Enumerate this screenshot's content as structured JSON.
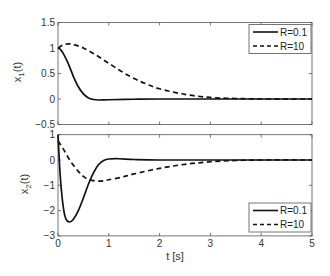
{
  "chart_data": [
    {
      "type": "line",
      "title": "",
      "xlabel": "",
      "ylabel": "x1(t)",
      "ylabel_main": "x",
      "ylabel_sub": "1",
      "ylabel_tail": "(t)",
      "xlim": [
        0,
        5
      ],
      "ylim": [
        -0.5,
        1.5
      ],
      "xticks": [
        "0",
        "1",
        "2",
        "3",
        "4",
        "5"
      ],
      "yticks": [
        "1.5",
        "1",
        "0.5",
        "0",
        "-0.5"
      ],
      "ytick_values": [
        1.5,
        1,
        0.5,
        0,
        -0.5
      ],
      "show_xtick_labels": false,
      "grid": false,
      "legend_position": "upper right",
      "legend": [
        "R=0.1",
        "R=10"
      ],
      "series": [
        {
          "name": "R=0.1",
          "style": "solid",
          "x": [
            0,
            0.05,
            0.1,
            0.2,
            0.3,
            0.4,
            0.5,
            0.6,
            0.7,
            0.8,
            1.0,
            1.5,
            2,
            3,
            4,
            5
          ],
          "y": [
            1.0,
            0.97,
            0.9,
            0.7,
            0.45,
            0.24,
            0.1,
            0.02,
            -0.01,
            -0.02,
            -0.015,
            -0.005,
            0,
            0,
            0,
            0
          ]
        },
        {
          "name": "R=10",
          "style": "dashed",
          "x": [
            0,
            0.1,
            0.2,
            0.3,
            0.5,
            0.75,
            1.0,
            1.25,
            1.5,
            1.75,
            2.0,
            2.5,
            3.0,
            3.5,
            4,
            5
          ],
          "y": [
            1.0,
            1.06,
            1.08,
            1.07,
            1.0,
            0.86,
            0.7,
            0.54,
            0.4,
            0.29,
            0.2,
            0.09,
            0.03,
            0.01,
            0,
            0
          ]
        }
      ]
    },
    {
      "type": "line",
      "title": "",
      "xlabel": "t [s]",
      "ylabel": "x2(t)",
      "ylabel_main": "x",
      "ylabel_sub": "2",
      "ylabel_tail": "(t)",
      "xlim": [
        0,
        5
      ],
      "ylim": [
        -3,
        1
      ],
      "xticks": [
        "0",
        "1",
        "2",
        "3",
        "4",
        "5"
      ],
      "yticks": [
        "1",
        "0",
        "-1",
        "-2",
        "-3"
      ],
      "ytick_values": [
        1,
        0,
        -1,
        -2,
        -3
      ],
      "show_xtick_labels": true,
      "grid": false,
      "legend_position": "lower right",
      "legend": [
        "R=0.1",
        "R=10"
      ],
      "series": [
        {
          "name": "R=0.1",
          "style": "solid",
          "x": [
            0,
            0.02,
            0.05,
            0.1,
            0.15,
            0.22,
            0.3,
            0.4,
            0.5,
            0.6,
            0.7,
            0.8,
            0.9,
            1.0,
            1.2,
            1.5,
            2,
            3,
            4,
            5
          ],
          "y": [
            1.0,
            0.2,
            -0.8,
            -1.8,
            -2.3,
            -2.45,
            -2.35,
            -2.0,
            -1.5,
            -0.95,
            -0.5,
            -0.18,
            -0.02,
            0.04,
            0.05,
            0.02,
            0,
            0,
            0,
            0
          ]
        },
        {
          "name": "R=10",
          "style": "dashed",
          "x": [
            0,
            0.1,
            0.2,
            0.3,
            0.4,
            0.5,
            0.6,
            0.75,
            0.9,
            1.0,
            1.25,
            1.5,
            2.0,
            2.5,
            3.0,
            3.5,
            4,
            5
          ],
          "y": [
            0.75,
            0.45,
            0.1,
            -0.2,
            -0.45,
            -0.65,
            -0.77,
            -0.83,
            -0.82,
            -0.78,
            -0.68,
            -0.55,
            -0.33,
            -0.17,
            -0.07,
            -0.02,
            0,
            0
          ]
        }
      ]
    }
  ],
  "legend_labels": {
    "series_1": "R=0.1",
    "series_2": "R=10"
  },
  "xlabel": "t [s]"
}
